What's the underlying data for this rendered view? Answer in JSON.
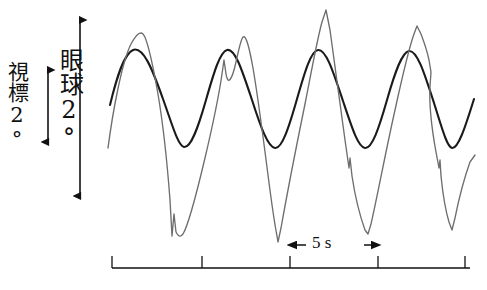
{
  "figure": {
    "type": "eye-movement-recording",
    "background_color": "#ffffff"
  },
  "axes": {
    "vertical_scale_eye": {
      "label": "眼球 2°",
      "label_text": "眼球2°",
      "magnitude": "2°",
      "arrow": "double-headed-vertical"
    },
    "vertical_scale_target": {
      "label": "視標 2°",
      "label_text": "視標2°",
      "magnitude": "2°",
      "arrow": "double-headed-vertical"
    },
    "time_axis": {
      "scale_label": "5 s",
      "tick_count": 5,
      "tick_interval_label": "5 s",
      "arrow": "double-headed-horizontal"
    }
  },
  "colors": {
    "target_trace": "#1a1a1a",
    "eye_trace": "#6e6e6e",
    "axis": "#1a1a1a"
  },
  "chart_data": {
    "type": "line",
    "title": "",
    "xlabel": "5 s",
    "ylabel": "眼球 2°",
    "grid": false,
    "legend": "none",
    "xlim": [
      110,
      477
    ],
    "ylim_pixels": [
      10,
      240
    ],
    "axis_note": "y is screen pixels, smaller value = larger upward deflection",
    "time_ticks_px": [
      112,
      202,
      290,
      378,
      465
    ],
    "tick_spacing_seconds": 5,
    "series": [
      {
        "name": "視標 (target)",
        "color": "#1a1a1a",
        "style": "smooth-sinusoid",
        "path": "M110,105 C117,76 124,54 133,50 C143,46 152,68 163,99 C172,124 178,146 184,147 C191,148 198,128 206,100 C214,72 220,52 227,50 C235,48 242,70 252,100 C261,128 268,147 275,148 C282,149 289,127 297,99 C305,71 311,51 318,50 C326,49 333,71 343,101 C352,128 358,147 365,148 C372,149 379,128 387,100 C395,72 402,52 409,51 C417,50 424,72 434,103 C442,128 447,147 452,148 C458,149 465,128 474,99",
        "peaks_px": [
          [
            133,
            50
          ],
          [
            227,
            50
          ],
          [
            318,
            50
          ],
          [
            409,
            51
          ]
        ],
        "troughs_px": [
          [
            184,
            147
          ],
          [
            275,
            148
          ],
          [
            365,
            148
          ],
          [
            452,
            148
          ]
        ]
      },
      {
        "name": "眼球 (eye)",
        "color": "#6e6e6e",
        "style": "pursuit-with-saccades",
        "path": "M108,148 C113,110 122,62 131,44 C136,35 140,31 143,34 C147,38 152,60 158,94 C163,124 167,160 170,200 L172,236 L174,214 L176,232 C178,236 180,238 183,234 C188,226 196,196 205,158 C213,124 219,95 222,74 L224,60 L226,74 C228,86 232,80 236,62 C239,48 241,39 243,37 C246,35 249,46 253,68 C258,97 263,136 268,175 C272,206 275,226 277,236 L278,242 L281,228 C286,200 296,148 305,104 C311,74 317,40 322,22 L326,10 L330,30 C334,58 340,104 345,140 L349,168 L350,158 L352,176 C355,196 360,216 365,230 L368,234 L371,224 C377,198 386,150 395,110 C402,78 409,48 414,34 L417,26 L421,34 C424,42 427,50 429,60 L431,72 L430,86 C429,104 432,130 436,152 L439,168 L440,160 L441,176 C443,196 446,212 449,222 L452,230 L455,218 C459,198 465,176 470,162 L475,155",
        "saccade_markers_px": [
          [
            172,
            236
          ],
          [
            224,
            60
          ],
          [
            326,
            10
          ],
          [
            350,
            158
          ],
          [
            421,
            34
          ],
          [
            440,
            160
          ]
        ],
        "peaks_px": [
          [
            143,
            34
          ],
          [
            243,
            37
          ],
          [
            326,
            10
          ],
          [
            417,
            26
          ]
        ],
        "troughs_px": [
          [
            172,
            236
          ],
          [
            277,
            240
          ],
          [
            368,
            234
          ],
          [
            452,
            230
          ]
        ]
      }
    ]
  }
}
